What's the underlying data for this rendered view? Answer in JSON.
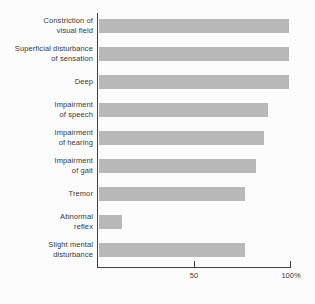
{
  "chart_data": {
    "type": "bar",
    "orientation": "horizontal",
    "title": "",
    "unit": "%",
    "xlim": [
      0,
      100
    ],
    "grid": false,
    "legend": false,
    "x_ticks": [
      {
        "value": 50,
        "label": "50"
      },
      {
        "value": 100,
        "label": "100%"
      }
    ],
    "categories": [
      "Constriction of visual field",
      "Superficial disturbance of sensation",
      "Deep",
      "Impairment of speech",
      "Impairment of hearing",
      "Impairment of gait",
      "Tremor",
      "Abnormal reflex",
      "Slight mental disturbance"
    ],
    "category_lines": [
      [
        "Constriction of",
        "visual field"
      ],
      [
        "Superficial disturbance",
        "of sensation"
      ],
      [
        "Deep"
      ],
      [
        "Impairment",
        "of speech"
      ],
      [
        "Impairment",
        "of hearing"
      ],
      [
        "Impairment",
        "of gait"
      ],
      [
        "Tremor"
      ],
      [
        "Abnormal",
        "reflex"
      ],
      [
        "Slight mental",
        "disturbance"
      ]
    ],
    "values": [
      99,
      99,
      99,
      88,
      86,
      82,
      76,
      12,
      76
    ],
    "colors": {
      "bar": "#b9b9b9",
      "axis": "#404040",
      "text": "#383838",
      "background": "#fcfcfc"
    }
  }
}
